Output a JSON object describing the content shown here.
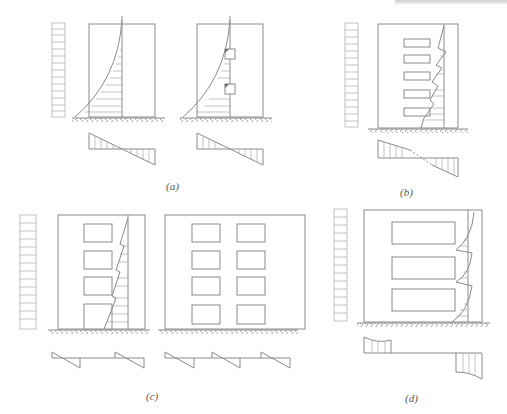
{
  "figure": {
    "panels": [
      {
        "id": "a",
        "label": "(a)",
        "description": "Solid wall and wall with small openings: parabolic stress distribution, linear foundation stress"
      },
      {
        "id": "b",
        "label": "(b)",
        "description": "Wall with a single column of openings: serrated stress distribution"
      },
      {
        "id": "c",
        "label": "(c)",
        "description": "Coupled walls with one or two columns of openings: local stress diagrams per pier"
      },
      {
        "id": "d",
        "label": "(d)",
        "description": "Frame-wall with large openings: separate pier stress blocks"
      }
    ],
    "load": {
      "type": "uniform-lateral-load",
      "arrow_count": 15
    },
    "colors": {
      "line": "#8a8a8a",
      "background": "#ffffff"
    }
  }
}
